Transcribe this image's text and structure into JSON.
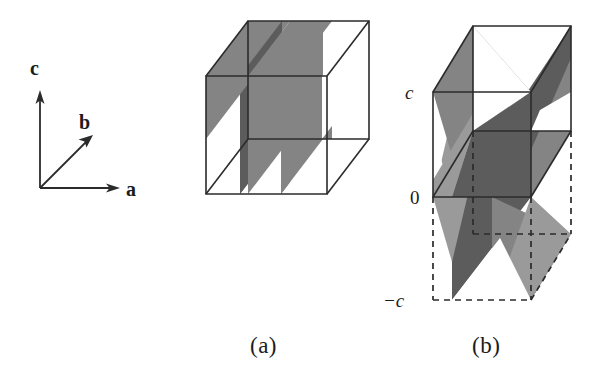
{
  "figure": {
    "type": "crystallographic-unit-cell-diagram",
    "background_color": "#ffffff",
    "line_color": "#2b2b2b",
    "captions": {
      "a": "(a)",
      "b": "(b)"
    },
    "axis_triad": {
      "origin": [
        40,
        188
      ],
      "labels": {
        "a": "a",
        "b": "b",
        "c": "c"
      },
      "label_positions": {
        "a": [
          128,
          196
        ],
        "b": [
          82,
          123
        ],
        "c": [
          36,
          68
        ]
      },
      "arrows": {
        "a": {
          "from": [
            40,
            188
          ],
          "to": [
            118,
            188
          ]
        },
        "b": {
          "from": [
            40,
            188
          ],
          "to": [
            92,
            136
          ]
        },
        "c": {
          "from": [
            40,
            188
          ],
          "to": [
            40,
            96
          ]
        }
      }
    },
    "shading": {
      "light_gray": "#9a9a9a",
      "medium_gray": "#848484",
      "dark_gray": "#5c5c5c",
      "white": "#ffffff"
    },
    "cell_a": {
      "name": "unit-cell-a",
      "description": "Orthorhombic unit cell showing a set of parallel inclined lattice planes",
      "box": {
        "front_bottom_left": [
          206,
          194
        ],
        "front_bottom_right": [
          327,
          194
        ],
        "front_top_left": [
          206,
          76
        ],
        "front_top_right": [
          327,
          76
        ],
        "back_bottom_left": [
          248,
          139
        ],
        "back_bottom_right": [
          369,
          139
        ],
        "back_top_left": [
          248,
          21
        ],
        "back_top_right": [
          369,
          21
        ]
      }
    },
    "cell_b": {
      "name": "unit-cell-b",
      "description": "Tetragonal unit cell with doubled c-axis showing intersecting planes; lower cell drawn dashed",
      "labels": {
        "c_top": "c",
        "origin": "0",
        "c_bottom": "−c"
      },
      "label_positions": {
        "c_top": [
          405,
          99
        ],
        "origin": [
          410,
          204
        ],
        "c_bottom": [
          386,
          307
        ]
      },
      "box_upper": {
        "front_bottom_left": [
          433,
          197
        ],
        "front_bottom_right": [
          531,
          197
        ],
        "front_top_left": [
          433,
          92
        ],
        "front_top_right": [
          531,
          92
        ],
        "back_bottom_left": [
          473,
          131
        ],
        "back_bottom_right": [
          571,
          131
        ],
        "back_top_left": [
          473,
          26
        ],
        "back_top_right": [
          571,
          26
        ]
      },
      "box_lower_dashed": {
        "front_bottom_left": [
          433,
          300
        ],
        "front_bottom_right": [
          531,
          300
        ],
        "back_bottom_left": [
          473,
          234
        ],
        "back_bottom_right": [
          571,
          234
        ]
      }
    }
  }
}
